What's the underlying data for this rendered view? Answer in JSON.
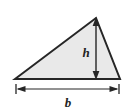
{
  "figure": {
    "kind": "geometry-diagram",
    "shape": "triangle",
    "canvas": {
      "width": 124,
      "height": 112
    },
    "colors": {
      "background": "#ffffff",
      "fill": "#e9e9e9",
      "outline": "#262626",
      "dimension_line": "#262626",
      "label": "#232323"
    },
    "triangle": {
      "vertices": [
        {
          "name": "bottom-left",
          "x": 15,
          "y": 79
        },
        {
          "name": "apex",
          "x": 96,
          "y": 18
        },
        {
          "name": "bottom-right",
          "x": 120,
          "y": 79
        }
      ],
      "stroke_width": 2
    },
    "height_dimension": {
      "label": "h",
      "label_x": 86,
      "label_y": 57,
      "line_x": 96,
      "y_top": 19,
      "y_bottom": 78,
      "arrow_heads": "both",
      "stroke_width": 1.4
    },
    "base_dimension": {
      "label": "b",
      "label_x": 68,
      "label_y": 107,
      "line_y": 89,
      "x_left": 16,
      "x_right": 119,
      "tick_half_height": 5,
      "arrow_heads": "both-inward",
      "stroke_width": 1.2
    }
  }
}
